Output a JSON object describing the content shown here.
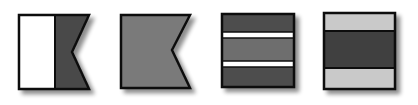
{
  "flags": [
    {
      "id": "flag-1",
      "shape": "swallowtail",
      "parts": {
        "hoist": "#ffffff",
        "fly": "#4a4a4a"
      }
    },
    {
      "id": "flag-2",
      "shape": "swallowtail",
      "parts": {
        "field": "#7a7a7a"
      }
    },
    {
      "id": "flag-3",
      "shape": "rectangle",
      "stripes": [
        "#4e4e4e",
        "#ffffff",
        "#6e6e6e",
        "#ffffff",
        "#4e4e4e"
      ]
    },
    {
      "id": "flag-4",
      "shape": "rectangle",
      "stripes": [
        "#c9c9c9",
        "#3f3f3f",
        "#c9c9c9"
      ]
    }
  ],
  "colors": {
    "outline": "#111111",
    "shadow": "#9a9a9a",
    "background": "#ffffff"
  }
}
